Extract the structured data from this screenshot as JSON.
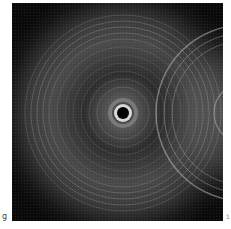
{
  "figure": {
    "panel_label": "g",
    "corner_mark": "1",
    "image": {
      "description": "Grayscale concentric ring interference pattern with dark central spot and a second ring system entering from the right edge",
      "background_color": "#0d0d0d",
      "ring_color": "#bfbfbf",
      "center_spot_color": "#000000"
    }
  }
}
